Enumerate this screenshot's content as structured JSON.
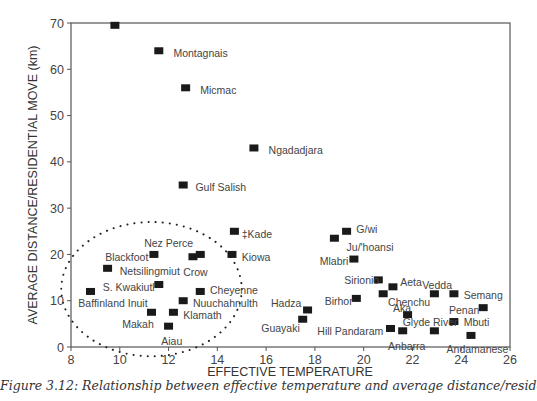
{
  "chart_data": {
    "type": "scatter",
    "title": "",
    "xlabel": "EFFECTIVE TEMPERATURE",
    "ylabel": "AVERAGE DISTANCE/RESIDENTIAL MOVE (km)",
    "xlim": [
      8,
      26
    ],
    "ylim": [
      0,
      70
    ],
    "xticks": [
      8,
      10,
      12,
      14,
      16,
      18,
      20,
      22,
      24,
      26
    ],
    "yticks": [
      0,
      10,
      20,
      30,
      40,
      50,
      60,
      70
    ],
    "grid": false,
    "marker": "square",
    "points": [
      {
        "label": "Nunamiut",
        "x": 9.8,
        "y": 69.5,
        "lx": -1.8,
        "ly": 65.5
      },
      {
        "label": "Montagnais",
        "x": 11.6,
        "y": 64,
        "lx": 12.2,
        "ly": 63.5
      },
      {
        "label": "Micmac",
        "x": 12.7,
        "y": 56,
        "lx": 13.3,
        "ly": 55.5
      },
      {
        "label": "Ngadadjara",
        "x": 15.5,
        "y": 43,
        "lx": 16.1,
        "ly": 42.5
      },
      {
        "label": "Gulf Salish",
        "x": 12.6,
        "y": 35,
        "lx": 13.1,
        "ly": 34.5
      },
      {
        "label": "‡Kade",
        "x": 14.7,
        "y": 25,
        "lx": 15.0,
        "ly": 24.5
      },
      {
        "label": "Nez Perce",
        "x": 13.3,
        "y": 20,
        "lx": 11.0,
        "ly": 22.5
      },
      {
        "label": "Kiowa",
        "x": 14.6,
        "y": 20,
        "lx": 15.0,
        "ly": 19.5
      },
      {
        "label": "Crow",
        "x": 13.0,
        "y": 19.5,
        "lx": 12.6,
        "ly": 16.3
      },
      {
        "label": "Blackfoot",
        "x": 11.4,
        "y": 20,
        "lx": 9.4,
        "ly": 19.5
      },
      {
        "label": "Netsilingmiut",
        "x": 9.5,
        "y": 17,
        "lx": 10.0,
        "ly": 16.5
      },
      {
        "label": "S. Kwakiutl",
        "x": 11.6,
        "y": 13.5,
        "lx": 9.3,
        "ly": 13.0
      },
      {
        "label": "Baffinland Inuit",
        "x": 8.8,
        "y": 12,
        "lx": 8.3,
        "ly": 9.5
      },
      {
        "label": "Cheyenne",
        "x": 13.3,
        "y": 12,
        "lx": 13.7,
        "ly": 12.3
      },
      {
        "label": "Nuuchahnulth",
        "x": 12.6,
        "y": 10,
        "lx": 13.0,
        "ly": 9.5
      },
      {
        "label": "Klamath",
        "x": 12.2,
        "y": 7.5,
        "lx": 12.6,
        "ly": 7.0
      },
      {
        "label": "Makah",
        "x": 11.3,
        "y": 7.5,
        "lx": 10.1,
        "ly": 5.0
      },
      {
        "label": "Aiau",
        "x": 12.0,
        "y": 4.5,
        "lx": 11.7,
        "ly": 1.3
      },
      {
        "label": "Hadza",
        "x": 17.7,
        "y": 8,
        "lx": 16.2,
        "ly": 9.5
      },
      {
        "label": "Guayaki",
        "x": 17.5,
        "y": 6,
        "lx": 15.8,
        "ly": 4.0
      },
      {
        "label": "G/wi",
        "x": 19.3,
        "y": 25,
        "lx": 19.7,
        "ly": 25.5
      },
      {
        "label": "Ju/'hoansi",
        "x": 18.8,
        "y": 23.5,
        "lx": 19.3,
        "ly": 21.5
      },
      {
        "label": "Mlabri",
        "x": 19.6,
        "y": 19,
        "lx": 18.2,
        "ly": 18.5
      },
      {
        "label": "Sirionio",
        "x": 20.6,
        "y": 14.5,
        "lx": 19.2,
        "ly": 14.5
      },
      {
        "label": "Aeta",
        "x": 21.2,
        "y": 13,
        "lx": 21.5,
        "ly": 14.0
      },
      {
        "label": "Vedda",
        "x": 22.9,
        "y": 11.5,
        "lx": 22.4,
        "ly": 13.5
      },
      {
        "label": "Semang",
        "x": 23.7,
        "y": 11.5,
        "lx": 24.1,
        "ly": 11.3
      },
      {
        "label": "Chenchu",
        "x": 20.8,
        "y": 11.5,
        "lx": 21.0,
        "ly": 9.8
      },
      {
        "label": "Birhor",
        "x": 19.7,
        "y": 10.5,
        "lx": 18.4,
        "ly": 10.0
      },
      {
        "label": "Penan",
        "x": 24.9,
        "y": 8.5,
        "lx": 23.5,
        "ly": 8.0
      },
      {
        "label": "Aka",
        "x": 21.8,
        "y": 7,
        "lx": 21.2,
        "ly": 8.5
      },
      {
        "label": "Mbuti",
        "x": 23.7,
        "y": 5.5,
        "lx": 24.1,
        "ly": 5.3
      },
      {
        "label": "Glyde River",
        "x": 22.9,
        "y": 3.5,
        "lx": 21.6,
        "ly": 5.3
      },
      {
        "label": "Hill Pandaram",
        "x": 21.1,
        "y": 4,
        "lx": 18.1,
        "ly": 3.5
      },
      {
        "label": "Anbarra",
        "x": 21.6,
        "y": 3.5,
        "lx": 21.0,
        "ly": 0.3
      },
      {
        "label": "Andamanese",
        "x": 24.4,
        "y": 2.5,
        "lx": 23.4,
        "ly": -0.5
      }
    ],
    "annotations": [
      {
        "type": "dotted-ellipse",
        "cx": 11.3,
        "cy": 12.5,
        "rx": 3.7,
        "ry": 14.5
      }
    ]
  },
  "caption": "Figure 3.12: Relationship between effective temperature and average distance/residential move (after"
}
